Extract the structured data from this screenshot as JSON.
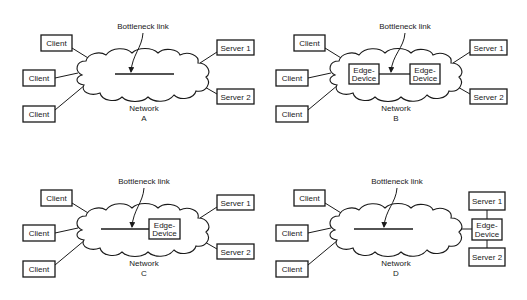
{
  "diagram": {
    "bottleneck_label": "Bottleneck link",
    "network_label": "Network",
    "client_label": "Client",
    "edge_label_line1": "Edge-",
    "edge_label_line2": "Device",
    "server1_label": "Server 1",
    "server2_label": "Server 2",
    "panels": [
      {
        "id": "A",
        "letter": "A",
        "edge_devices": "none"
      },
      {
        "id": "B",
        "letter": "B",
        "edge_devices": "both ends of bottleneck link, inside network"
      },
      {
        "id": "C",
        "letter": "C",
        "edge_devices": "server side of bottleneck link, inside network"
      },
      {
        "id": "D",
        "letter": "D",
        "edge_devices": "outside network, between network and servers"
      }
    ]
  }
}
